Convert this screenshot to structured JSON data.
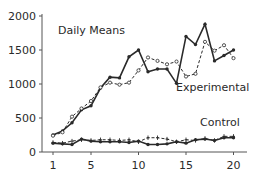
{
  "chart_data": {
    "type": "line",
    "title": "Daily Means",
    "xlabel": "",
    "ylabel": "",
    "x": [
      1,
      2,
      3,
      4,
      5,
      6,
      7,
      8,
      9,
      10,
      11,
      12,
      13,
      14,
      15,
      16,
      17,
      18,
      19,
      20
    ],
    "xticks": [
      1,
      5,
      10,
      15,
      20
    ],
    "yticks": [
      0,
      500,
      1000,
      1500,
      2000
    ],
    "xlim": [
      0,
      21
    ],
    "ylim": [
      0,
      2000
    ],
    "grid": false,
    "legend": "none (inline labels)",
    "annotations": [
      "Daily Means",
      "Experimental",
      "Control"
    ],
    "series": [
      {
        "name": "Experimental (solid)",
        "group": "Experimental",
        "style": "solid",
        "marker": "filled-dot",
        "values": [
          250,
          310,
          430,
          620,
          680,
          940,
          1100,
          1090,
          1400,
          1500,
          1180,
          1220,
          1220,
          1010,
          1700,
          1580,
          1880,
          1340,
          1420,
          1500
        ]
      },
      {
        "name": "Experimental (dashed)",
        "group": "Experimental",
        "style": "dashed",
        "marker": "open-dot",
        "values": [
          240,
          290,
          520,
          640,
          750,
          950,
          1020,
          990,
          1020,
          1200,
          1390,
          1340,
          1290,
          1330,
          1110,
          1150,
          1620,
          1490,
          1570,
          1380
        ]
      },
      {
        "name": "Control (solid)",
        "group": "Control",
        "style": "solid",
        "marker": "filled-dot",
        "values": [
          130,
          120,
          110,
          190,
          160,
          150,
          150,
          150,
          140,
          160,
          110,
          110,
          120,
          150,
          130,
          180,
          190,
          170,
          210,
          210
        ]
      },
      {
        "name": "Control (dashed)",
        "group": "Control",
        "style": "dashed",
        "marker": "plus",
        "values": [
          140,
          130,
          160,
          180,
          170,
          180,
          180,
          170,
          180,
          150,
          210,
          210,
          190,
          150,
          180,
          170,
          200,
          170,
          230,
          230
        ]
      }
    ]
  },
  "labels": {
    "title": "Daily Means",
    "experimental": "Experimental",
    "control": "Control"
  },
  "colors": {
    "ink": "#2a2a2a",
    "axis": "#555555"
  }
}
